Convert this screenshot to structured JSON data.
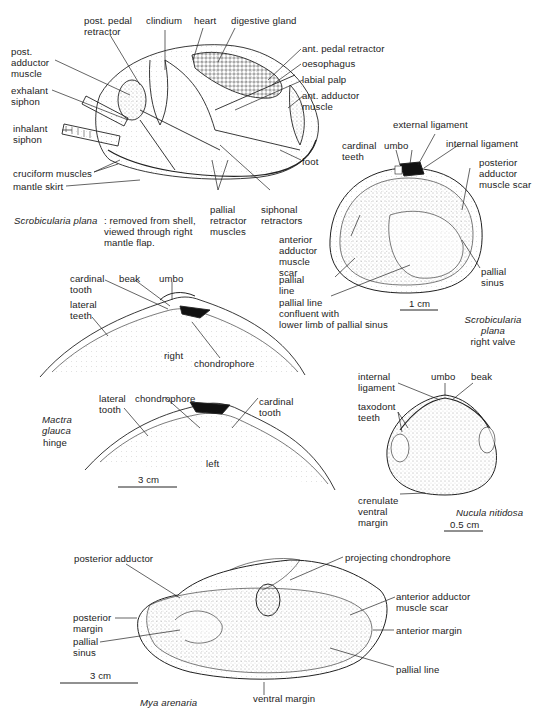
{
  "figure_1": {
    "caption_species": "Scrobicularia plana",
    "caption_rest": ": removed from shell,\nviewed through right\nmantle flap.",
    "labels": {
      "post_pedal_retractor": "post. pedal\nretractor",
      "clindium": "clindium",
      "heart": "heart",
      "digestive_gland": "digestive gland",
      "post_adductor_muscle": "post.\nadductor\nmuscle",
      "exhalant_siphon": "exhalant\nsiphon",
      "inhalant_siphon": "inhalant\nsiphon",
      "ant_pedal_retractor": "ant. pedal retractor",
      "oesophagus": "oesophagus",
      "labial_palp": "labial palp",
      "ant_adductor_muscle": "ant. adductor\nmuscle",
      "foot": "foot",
      "cruciform_muscles": "cruciform muscles",
      "mantle_skirt": "mantle skirt",
      "pallial_retractor_muscles": "pallial\nretractor\nmuscles",
      "siphonal_retractors": "siphonal\nretractors"
    }
  },
  "figure_2": {
    "species": "Scrobicularia\nplana",
    "view": "right valve",
    "scale": "1 cm",
    "labels": {
      "external_ligament": "external ligament",
      "cardinal_teeth": "cardinal\nteeth",
      "umbo": "umbo",
      "internal_ligament": "internal ligament",
      "posterior_adductor_muscle_scar": "posterior\nadductor\nmuscle scar",
      "anterior_adductor_muscle_scar": "anterior\nadductor\nmuscle\nscar",
      "pallial_line": "pallial\nline",
      "pallial_line_confluent": "pallial line\nconfluent with\nlower limb of pallial sinus",
      "pallial_sinus": "pallial\nsinus"
    }
  },
  "figure_3": {
    "species": "Mactra\nglauca",
    "subtitle": "hinge",
    "scale": "3 cm",
    "right_valve": {
      "side_label": "right",
      "labels": {
        "cardinal_tooth": "cardinal\ntooth",
        "beak": "beak",
        "umbo": "umbo",
        "lateral_teeth": "lateral\nteeth",
        "chondrophore": "chondrophore"
      }
    },
    "left_valve": {
      "side_label": "left",
      "labels": {
        "lateral_tooth": "lateral\ntooth",
        "chondrophore": "chondrophore",
        "cardinal_tooth": "cardinal\ntooth"
      }
    }
  },
  "figure_4": {
    "species": "Nucula nitidosa",
    "scale": "0.5 cm",
    "labels": {
      "internal_ligament": "internal\nligament",
      "umbo": "umbo",
      "beak": "beak",
      "taxodont_teeth": "taxodont\nteeth",
      "crenulate_ventral_margin": "crenulate\nventral\nmargin"
    }
  },
  "figure_5": {
    "species": "Mya arenaria",
    "scale": "3 cm",
    "labels": {
      "posterior_adductor": "posterior adductor",
      "projecting_chondrophore": "projecting chondrophore",
      "anterior_adductor_muscle_scar": "anterior adductor\nmuscle scar",
      "anterior_margin": "anterior margin",
      "posterior_margin": "posterior\nmargin",
      "pallial_sinus": "pallial\nsinus",
      "pallial_line": "pallial line",
      "ventral_margin": "ventral margin"
    }
  }
}
